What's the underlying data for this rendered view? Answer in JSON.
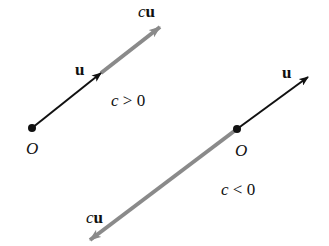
{
  "diagram": {
    "colors": {
      "u_vector": "#111111",
      "cu_vector": "#8a8a8a",
      "origin": "#111111",
      "text": "#111111"
    },
    "left_panel": {
      "origin_label": "O",
      "u_label": "u",
      "cu_label_c": "c",
      "cu_label_u": "u",
      "condition": "c > 0",
      "origin": [
        32,
        128
      ],
      "u_tip": [
        101,
        73
      ],
      "cu_tip": [
        160,
        27
      ]
    },
    "right_panel": {
      "origin_label": "O",
      "u_label": "u",
      "cu_label_c": "c",
      "cu_label_u": "u",
      "condition": "c < 0",
      "origin": [
        237,
        129
      ],
      "u_tip": [
        308,
        77
      ],
      "cu_tip": [
        90,
        240
      ]
    }
  }
}
